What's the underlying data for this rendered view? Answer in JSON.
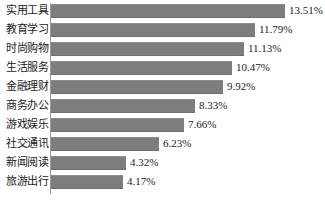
{
  "chart_data": {
    "type": "bar",
    "orientation": "horizontal",
    "title": "",
    "xlabel": "",
    "ylabel": "",
    "grid": false,
    "legend": false,
    "xlim": [
      0,
      13.51
    ],
    "value_suffix": "%",
    "categories": [
      "实用工具",
      "教育学习",
      "时尚购物",
      "生活服务",
      "金融理财",
      "商务办公",
      "游戏娱乐",
      "社交通讯",
      "新闻阅读",
      "旅游出行"
    ],
    "values": [
      13.51,
      11.79,
      11.13,
      10.47,
      9.92,
      8.33,
      7.66,
      6.23,
      4.32,
      4.17
    ],
    "value_labels": [
      "13.51%",
      "11.79%",
      "11.13%",
      "10.47%",
      "9.92%",
      "8.33%",
      "7.66%",
      "6.23%",
      "4.32%",
      "4.17%"
    ],
    "colors": {
      "bar": "#7d7d7d",
      "axis": "#9a9a9a",
      "text": "#1a1a1a",
      "background": "#ffffff"
    }
  }
}
